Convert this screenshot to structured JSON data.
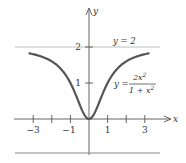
{
  "chart_data": {
    "type": "line",
    "title": "",
    "xlabel": "x",
    "ylabel": "y",
    "xlim": [
      -3.2,
      3.2
    ],
    "ylim": [
      0,
      2
    ],
    "x_ticks": [
      -3,
      -2,
      -1,
      1,
      2,
      3
    ],
    "x_tick_labels": [
      "-3",
      "-1",
      "1",
      "3"
    ],
    "x_tick_label_positions": [
      -3,
      -1,
      1,
      3
    ],
    "y_ticks": [
      1,
      2
    ],
    "y_tick_labels": [
      "1",
      "2"
    ],
    "grid": false,
    "series": [
      {
        "name": "y = 2x^2/(1+x^2)",
        "function": "2*x^2/(1+x^2)",
        "x": [
          -3.2,
          -3,
          -2.5,
          -2,
          -1.5,
          -1,
          -0.5,
          0,
          0.5,
          1,
          1.5,
          2,
          2.5,
          3,
          3.2
        ],
        "values": [
          1.822,
          1.8,
          1.724,
          1.6,
          1.385,
          1.0,
          0.4,
          0.0,
          0.4,
          1.0,
          1.385,
          1.6,
          1.724,
          1.8,
          1.822
        ]
      },
      {
        "name": "y = 2",
        "function": "2",
        "x": [
          -3.5,
          3.5
        ],
        "values": [
          2,
          2
        ],
        "style": "asymptote"
      }
    ],
    "annotations": [
      {
        "text": "y = 2",
        "near": "horizontal asymptote"
      },
      {
        "text": "y = 2x²/(1 + x²)",
        "near": "right branch of curve"
      }
    ]
  },
  "labels": {
    "x_axis": "x",
    "y_axis": "y",
    "asymptote": "y = 2",
    "curve_lhs": "y =",
    "curve_num": "2x",
    "curve_num_exp": "2",
    "curve_den": "1 + x",
    "curve_den_exp": "2",
    "tick_neg3": "−3",
    "tick_neg1": "−1",
    "tick_1": "1",
    "tick_3": "3",
    "ytick_1": "1",
    "ytick_2": "2"
  },
  "colors": {
    "curve": "#555555",
    "axis": "#555555",
    "asymptote": "#aaaaaa",
    "text": "#333333"
  }
}
